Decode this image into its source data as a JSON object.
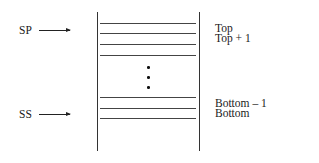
{
  "diagram": {
    "pointers": [
      {
        "label": "SP",
        "target": "Top"
      },
      {
        "label": "SS",
        "target": "Bottom"
      }
    ],
    "right_labels": {
      "top": "Top",
      "top_plus_1": "Top + 1",
      "bottom_minus_1": "Bottom – 1",
      "bottom": "Bottom"
    },
    "ellipsis": "vertical-dots"
  }
}
